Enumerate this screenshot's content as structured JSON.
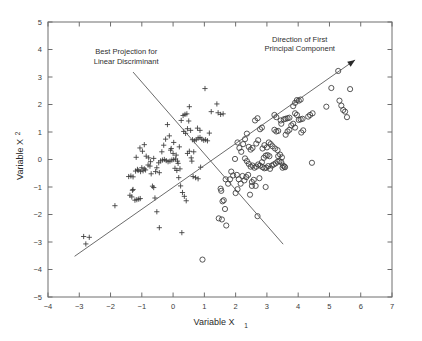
{
  "chart_data": {
    "type": "scatter",
    "title": "",
    "xlabel": "Variable X",
    "xlabel_sub": "1",
    "ylabel": "Variable X",
    "ylabel_sub": "2",
    "xlim": [
      -4,
      7
    ],
    "ylim": [
      -5,
      5
    ],
    "xticks": [
      -4,
      -3,
      -2,
      -1,
      0,
      1,
      2,
      3,
      4,
      5,
      6,
      7
    ],
    "yticks": [
      5,
      4,
      3,
      2,
      1,
      0,
      -1,
      -2,
      -3,
      -4,
      -5
    ],
    "xtick_labels": [
      "-4",
      "-3",
      "-2",
      "-1",
      "0",
      "1",
      "2",
      "3",
      "4",
      "5",
      "6",
      "7"
    ],
    "ytick_labels": [
      "5",
      "4",
      "3",
      "2",
      "1",
      "0",
      "-1",
      "-2",
      "-3",
      "-4",
      "-5"
    ],
    "grid": false,
    "legend": "none",
    "marker_color": "#3a3a3a",
    "line_color": "#5a5a5a",
    "series": [
      {
        "name": "class-plus",
        "marker": "plus",
        "points": [
          [
            -2.86,
            -2.8
          ],
          [
            -2.79,
            -3.07
          ],
          [
            -2.68,
            -2.83
          ],
          [
            -1.86,
            -1.68
          ],
          [
            -1.38,
            -1.3
          ],
          [
            -1.32,
            -1.36
          ],
          [
            -1.28,
            -1.09
          ],
          [
            -1.3,
            -1.12
          ],
          [
            -1.22,
            -1.48
          ],
          [
            -1.16,
            -1.46
          ],
          [
            -1.1,
            -1.44
          ],
          [
            -1.05,
            -1.42
          ],
          [
            -1.42,
            -0.62
          ],
          [
            -1.35,
            -0.6
          ],
          [
            -1.28,
            -0.63
          ],
          [
            -1.2,
            -0.42
          ],
          [
            -1.12,
            -0.4
          ],
          [
            -1.04,
            -0.44
          ],
          [
            -0.96,
            -0.41
          ],
          [
            -0.88,
            -0.38
          ],
          [
            -1.18,
            0.08
          ],
          [
            -1.06,
            0.42
          ],
          [
            -0.98,
            0.3
          ],
          [
            -0.92,
            0.54
          ],
          [
            -0.86,
            0.12
          ],
          [
            -0.8,
            -0.2
          ],
          [
            -0.74,
            -0.24
          ],
          [
            -0.7,
            -0.52
          ],
          [
            -0.66,
            -0.97
          ],
          [
            -0.62,
            -1.02
          ],
          [
            -0.58,
            -1.4
          ],
          [
            -0.52,
            -1.9
          ],
          [
            -0.44,
            -2.48
          ],
          [
            -0.52,
            -0.3
          ],
          [
            -0.46,
            -0.12
          ],
          [
            -0.4,
            -0.05
          ],
          [
            -0.34,
            -0.02
          ],
          [
            -0.28,
            0.0
          ],
          [
            -0.22,
            -0.04
          ],
          [
            -0.16,
            -0.08
          ],
          [
            -0.1,
            -0.06
          ],
          [
            -0.04,
            -0.02
          ],
          [
            0.02,
            0.0
          ],
          [
            0.08,
            0.02
          ],
          [
            0.14,
            -0.06
          ],
          [
            -0.36,
            0.28
          ],
          [
            -0.3,
            0.52
          ],
          [
            -0.24,
            0.74
          ],
          [
            -0.18,
            1.27
          ],
          [
            -0.12,
            0.86
          ],
          [
            -0.06,
            0.4
          ],
          [
            0.0,
            0.22
          ],
          [
            0.06,
            -0.32
          ],
          [
            0.12,
            -0.4
          ],
          [
            0.18,
            -0.66
          ],
          [
            0.24,
            -0.96
          ],
          [
            0.3,
            -1.2
          ],
          [
            0.36,
            -1.34
          ],
          [
            0.42,
            -1.5
          ],
          [
            0.28,
            -2.66
          ],
          [
            0.46,
            0.22
          ],
          [
            0.52,
            0.3
          ],
          [
            0.58,
            0.06
          ],
          [
            0.34,
            1.02
          ],
          [
            0.4,
            0.95
          ],
          [
            0.46,
            1.12
          ],
          [
            0.26,
            1.42
          ],
          [
            0.32,
            1.6
          ],
          [
            0.38,
            1.64
          ],
          [
            0.44,
            1.66
          ],
          [
            0.5,
            1.4
          ],
          [
            0.56,
            1.06
          ],
          [
            0.62,
            0.72
          ],
          [
            0.68,
            0.68
          ],
          [
            0.74,
            0.72
          ],
          [
            0.8,
            0.78
          ],
          [
            0.86,
            0.8
          ],
          [
            0.92,
            0.74
          ],
          [
            0.98,
            0.7
          ],
          [
            1.04,
            0.72
          ],
          [
            1.1,
            0.68
          ],
          [
            0.64,
            -0.62
          ],
          [
            0.72,
            -0.66
          ],
          [
            0.8,
            -0.7
          ],
          [
            0.88,
            -0.28
          ],
          [
            0.6,
            -0.06
          ],
          [
            0.66,
            0.28
          ],
          [
            0.78,
            1.14
          ],
          [
            0.86,
            1.06
          ],
          [
            0.52,
            1.92
          ],
          [
            1.44,
            1.7
          ],
          [
            1.52,
            1.64
          ],
          [
            1.6,
            1.66
          ],
          [
            1.4,
            2.02
          ],
          [
            1.02,
            2.58
          ],
          [
            1.22,
            1.74
          ],
          [
            0.22,
            -0.34
          ],
          [
            0.16,
            -0.14
          ],
          [
            0.1,
            0.16
          ],
          [
            -0.62,
            0.04
          ],
          [
            -0.56,
            -0.44
          ],
          [
            -0.44,
            -0.48
          ],
          [
            -0.72,
            -0.08
          ],
          [
            -0.78,
            0.06
          ],
          [
            -0.92,
            -0.34
          ],
          [
            -1.0,
            -0.3
          ],
          [
            -1.14,
            -0.36
          ],
          [
            0.2,
            0.46
          ],
          [
            0.02,
            0.62
          ],
          [
            -0.08,
            0.34
          ],
          [
            1.16,
            0.96
          ]
        ]
      },
      {
        "name": "class-circle",
        "marker": "circle",
        "points": [
          [
            1.52,
            -1.06
          ],
          [
            1.54,
            -1.14
          ],
          [
            1.58,
            -1.52
          ],
          [
            1.62,
            -1.48
          ],
          [
            1.66,
            -1.8
          ],
          [
            1.7,
            -2.4
          ],
          [
            1.56,
            -2.18
          ],
          [
            1.46,
            -2.14
          ],
          [
            0.94,
            -3.64
          ],
          [
            1.68,
            -0.72
          ],
          [
            1.76,
            -0.88
          ],
          [
            1.86,
            -0.44
          ],
          [
            1.92,
            -0.58
          ],
          [
            1.98,
            0.02
          ],
          [
            2.04,
            -0.56
          ],
          [
            2.1,
            -0.72
          ],
          [
            2.16,
            -0.88
          ],
          [
            2.22,
            -0.6
          ],
          [
            2.28,
            -0.76
          ],
          [
            2.34,
            -0.64
          ],
          [
            2.4,
            -0.56
          ],
          [
            2.46,
            -1.28
          ],
          [
            2.52,
            -0.82
          ],
          [
            2.58,
            -0.74
          ],
          [
            2.64,
            -0.96
          ],
          [
            2.7,
            -2.06
          ],
          [
            2.76,
            -0.68
          ],
          [
            2.3,
            0.04
          ],
          [
            2.36,
            -0.06
          ],
          [
            2.42,
            -0.16
          ],
          [
            2.48,
            -0.26
          ],
          [
            2.54,
            -0.22
          ],
          [
            2.6,
            -0.3
          ],
          [
            2.66,
            -0.26
          ],
          [
            2.72,
            -0.18
          ],
          [
            2.78,
            -0.22
          ],
          [
            2.84,
            -0.1
          ],
          [
            2.9,
            0.06
          ],
          [
            2.96,
            0.14
          ],
          [
            3.02,
            0.16
          ],
          [
            3.08,
            0.12
          ],
          [
            2.86,
            -0.28
          ],
          [
            2.92,
            -0.32
          ],
          [
            2.98,
            -0.3
          ],
          [
            3.04,
            -0.24
          ],
          [
            3.1,
            -0.34
          ],
          [
            3.16,
            -0.22
          ],
          [
            3.22,
            -0.18
          ],
          [
            3.28,
            -0.14
          ],
          [
            3.34,
            -0.08
          ],
          [
            3.4,
            -0.06
          ],
          [
            3.46,
            -0.1
          ],
          [
            3.52,
            -0.22
          ],
          [
            3.58,
            -0.28
          ],
          [
            3.36,
            0.12
          ],
          [
            3.42,
            0.18
          ],
          [
            3.48,
            0.08
          ],
          [
            2.18,
            0.28
          ],
          [
            2.24,
            0.56
          ],
          [
            2.3,
            0.74
          ],
          [
            2.36,
            0.94
          ],
          [
            2.42,
            0.46
          ],
          [
            2.48,
            0.36
          ],
          [
            2.54,
            0.42
          ],
          [
            2.12,
            0.42
          ],
          [
            2.06,
            0.62
          ],
          [
            2.86,
            0.4
          ],
          [
            2.92,
            0.52
          ],
          [
            3.0,
            0.44
          ],
          [
            3.06,
            0.62
          ],
          [
            3.12,
            0.56
          ],
          [
            3.18,
            0.48
          ],
          [
            3.26,
            0.4
          ],
          [
            3.34,
            0.34
          ],
          [
            2.72,
            0.7
          ],
          [
            2.66,
            0.58
          ],
          [
            2.78,
            1.1
          ],
          [
            2.84,
            1.16
          ],
          [
            3.24,
            1.08
          ],
          [
            3.3,
            1.02
          ],
          [
            3.36,
            1.04
          ],
          [
            3.6,
            0.9
          ],
          [
            3.66,
            1.02
          ],
          [
            3.72,
            1.08
          ],
          [
            3.78,
            1.24
          ],
          [
            3.84,
            1.3
          ],
          [
            3.9,
            1.16
          ],
          [
            3.54,
            1.46
          ],
          [
            3.6,
            1.48
          ],
          [
            3.66,
            1.5
          ],
          [
            3.72,
            1.52
          ],
          [
            3.44,
            1.42
          ],
          [
            3.3,
            1.54
          ],
          [
            3.24,
            1.62
          ],
          [
            3.9,
            1.68
          ],
          [
            3.96,
            1.62
          ],
          [
            4.02,
            1.44
          ],
          [
            4.08,
            1.46
          ],
          [
            4.14,
            1.48
          ],
          [
            3.84,
            1.94
          ],
          [
            3.9,
            2.06
          ],
          [
            3.96,
            2.16
          ],
          [
            4.02,
            2.14
          ],
          [
            4.08,
            2.18
          ],
          [
            4.32,
            1.56
          ],
          [
            4.38,
            1.62
          ],
          [
            4.46,
            1.68
          ],
          [
            4.44,
            -0.12
          ],
          [
            5.06,
            2.6
          ],
          [
            5.28,
            3.22
          ],
          [
            5.32,
            2.14
          ],
          [
            5.38,
            1.96
          ],
          [
            5.44,
            1.8
          ],
          [
            5.5,
            1.74
          ],
          [
            5.56,
            1.54
          ],
          [
            5.66,
            2.56
          ],
          [
            4.9,
            1.92
          ],
          [
            4.1,
            0.98
          ],
          [
            4.16,
            1.06
          ],
          [
            3.46,
            1.3
          ],
          [
            2.0,
            -1.22
          ],
          [
            2.06,
            -1.08
          ],
          [
            1.82,
            -0.72
          ],
          [
            2.96,
            -1.0
          ],
          [
            2.52,
            -0.96
          ],
          [
            3.5,
            -0.3
          ],
          [
            3.56,
            -0.26
          ],
          [
            2.62,
            1.42
          ],
          [
            2.7,
            1.5
          ]
        ]
      }
    ],
    "annotations": [
      {
        "name": "pca-annotation",
        "lines": [
          "Direction of First",
          "Principal Component"
        ],
        "x": 4.05,
        "y": 4.28
      },
      {
        "name": "lda-annotation",
        "lines": [
          "Best Projection for",
          "Linear Discriminant"
        ],
        "x": -1.5,
        "y": 3.82
      }
    ],
    "reference_lines": [
      {
        "name": "principal-component-line",
        "label": "Direction of First Principal Component",
        "x0": -3.15,
        "y0": -3.52,
        "x1": 5.82,
        "y1": 3.62,
        "arrow": true
      },
      {
        "name": "linear-discriminant-line",
        "label": "Best Projection for Linear Discriminant",
        "x0": -1.28,
        "y0": 3.18,
        "x1": 3.52,
        "y1": -3.08,
        "arrow": false
      }
    ]
  }
}
